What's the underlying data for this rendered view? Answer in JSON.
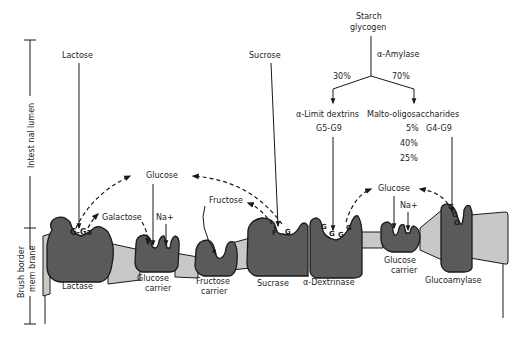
{
  "regions": {
    "lumen": "Intest nal lumen",
    "membrane_line1": "Brush border",
    "membrane_line2": "mem brane"
  },
  "substrates": {
    "lactose": "Lactose",
    "sucrose": "Sucrose",
    "starch_line1": "Starch",
    "starch_line2": "glycogen",
    "amylase": "α-Amylase",
    "split_left": "30%",
    "split_right": "70%",
    "limit_dextrins": "α-Limit dextrins",
    "limit_dextrins_range": "G5-G9",
    "malto": "Malto-oligosaccharides",
    "malto_pct1": "5%",
    "malto_range": "G4-G9",
    "malto_pct2": "40%",
    "malto_pct3": "25%"
  },
  "products": {
    "glucose_left": "Glucose",
    "galactose": "Galactose",
    "na_left": "Na+",
    "fructose": "Fructose",
    "glucose_right": "Glucose",
    "na_right": "Na+"
  },
  "bound": {
    "lactase_site": "G-Ga",
    "sucrase_site_f": "F",
    "sucrase_site_g": "G",
    "dextrinase_g": "G",
    "glucoamylase_g": "G"
  },
  "enzymes": [
    {
      "line1": "Lactase",
      "line2": ""
    },
    {
      "line1": "Glucose",
      "line2": "carrier"
    },
    {
      "line1": "Fructose",
      "line2": "carrier"
    },
    {
      "line1": "Sucrase",
      "line2": ""
    },
    {
      "line1": "α-Dextrinase",
      "line2": ""
    },
    {
      "line1": "Glucose",
      "line2": "carrier"
    },
    {
      "line1": "Glucoamylase",
      "line2": ""
    }
  ],
  "colors": {
    "enzyme_fill": "#5a5a5a",
    "membrane_fill": "#c8c8c8",
    "ink": "#1a1a1a"
  }
}
